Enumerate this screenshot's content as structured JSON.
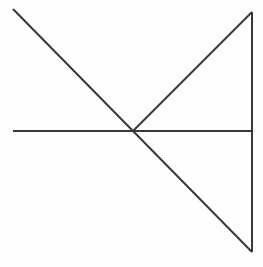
{
  "figure": {
    "width": 263,
    "height": 267,
    "background_color": "#fefefe",
    "stroke_color": "#383838",
    "stroke_width": 2,
    "vertices": {
      "top_left": [
        13,
        9
      ],
      "center": [
        133,
        131
      ],
      "apex_top_right": [
        252,
        12
      ],
      "bottom_right": [
        252,
        252
      ],
      "left_horizontal_end": [
        13,
        131
      ],
      "right_horizontal_end": [
        252,
        131
      ]
    },
    "segments": [
      {
        "name": "long-diagonal",
        "label": "Long diagonal from top-left through center to bottom-right",
        "x1": 13,
        "y1": 9,
        "x2": 252,
        "y2": 252
      },
      {
        "name": "horizontal-line",
        "label": "Horizontal line from left edge to vertical line",
        "x1": 13,
        "y1": 131,
        "x2": 252,
        "y2": 131
      },
      {
        "name": "vertical-line",
        "label": "Vertical line on right side from apex to bottom vertex",
        "x1": 252,
        "y1": 12,
        "x2": 252,
        "y2": 252
      },
      {
        "name": "upper-right-diagonal",
        "label": "Short diagonal from center up to top-right apex",
        "x1": 133,
        "y1": 131,
        "x2": 252,
        "y2": 12
      }
    ]
  }
}
